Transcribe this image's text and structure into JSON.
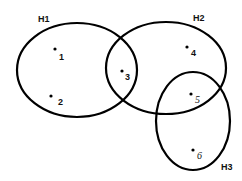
{
  "diagram": {
    "type": "hypergraph",
    "background": "#ffffff",
    "stroke_color": "#000000",
    "hyperedges": [
      {
        "id": "H1",
        "label": "H1",
        "members": [
          "1",
          "2",
          "3"
        ],
        "cx": 77,
        "cy": 70,
        "rx": 60,
        "ry": 47,
        "label_x": 38,
        "label_y": 22
      },
      {
        "id": "H2",
        "label": "H2",
        "members": [
          "3",
          "4",
          "5"
        ],
        "cx": 166,
        "cy": 68,
        "rx": 60,
        "ry": 46,
        "label_x": 193,
        "label_y": 21
      },
      {
        "id": "H3",
        "label": "H3",
        "members": [
          "5",
          "6"
        ],
        "cx": 193,
        "cy": 121,
        "rx": 37,
        "ry": 49,
        "label_x": 221,
        "label_y": 170
      }
    ],
    "nodes": [
      {
        "id": "1",
        "label": "1",
        "x": 55,
        "y": 49,
        "label_x": 59,
        "label_y": 60
      },
      {
        "id": "2",
        "label": "2",
        "x": 51,
        "y": 96,
        "label_x": 58,
        "label_y": 105
      },
      {
        "id": "3",
        "label": "3",
        "x": 122,
        "y": 71,
        "label_x": 125,
        "label_y": 80
      },
      {
        "id": "4",
        "label": "4",
        "x": 187,
        "y": 47,
        "label_x": 191,
        "label_y": 56
      },
      {
        "id": "5",
        "label": "5",
        "x": 191,
        "y": 94,
        "label_x": 195,
        "label_y": 103
      },
      {
        "id": "6",
        "label": "6",
        "x": 193,
        "y": 150,
        "label_x": 197,
        "label_y": 159
      }
    ]
  }
}
